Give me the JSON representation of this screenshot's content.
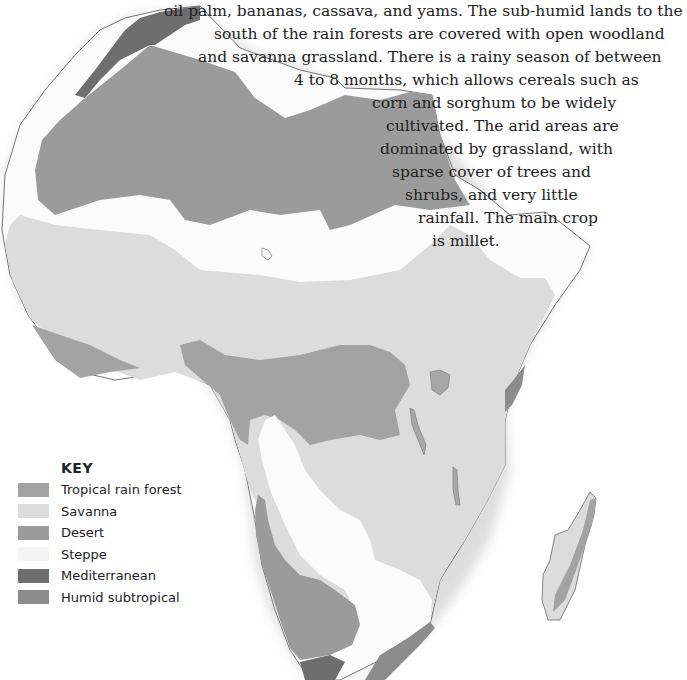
{
  "text": {
    "lines": [
      "… tropical crops such as cocoa, coffee, rubber,",
      "oil palm, bananas, cassava, and yams. The sub-humid lands to the",
      "south of the rain forests are covered with open woodland",
      "and savanna grassland. There is a rainy season of between",
      "4 to 8 months, which allows cereals such as",
      "corn and sorghum to be widely",
      "cultivated. The arid areas are",
      "dominated by grassland, with",
      "sparse cover of trees and",
      "shrubs, and very little",
      "rainfall. The main crop",
      "is millet."
    ]
  },
  "key": {
    "title": "KEY",
    "items": [
      {
        "label": "Tropical rain forest",
        "color": "#a3a3a3"
      },
      {
        "label": "Savanna",
        "color": "#dcdcdc"
      },
      {
        "label": "Desert",
        "color": "#9b9b9b"
      },
      {
        "label": "Steppe",
        "color": "#f3f3f3"
      },
      {
        "label": "Mediterranean",
        "color": "#6e6e6e"
      },
      {
        "label": "Humid subtropical",
        "color": "#8c8c8c"
      }
    ]
  },
  "map": {
    "title": "Africa vegetation zones",
    "colors": {
      "outline": "#555555",
      "desert": "#9b9b9b",
      "savanna": "#dcdcdc",
      "steppe": "#fbfbfb",
      "rainforest": "#a3a3a3",
      "mediterranean": "#6e6e6e",
      "humid_subtropical": "#8c8c8c"
    }
  }
}
